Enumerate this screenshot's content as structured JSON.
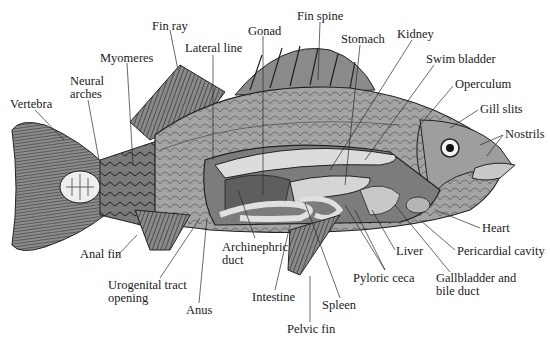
{
  "diagram": {
    "labels": [
      {
        "id": "fin-ray",
        "text": "Fin ray",
        "x": 152,
        "y": 20
      },
      {
        "id": "gonad",
        "text": "Gonad",
        "x": 248,
        "y": 25
      },
      {
        "id": "fin-spine",
        "text": "Fin spine",
        "x": 297,
        "y": 10
      },
      {
        "id": "kidney",
        "text": "Kidney",
        "x": 397,
        "y": 28
      },
      {
        "id": "stomach",
        "text": "Stomach",
        "x": 341,
        "y": 33
      },
      {
        "id": "lateral-line",
        "text": "Lateral line",
        "x": 185,
        "y": 42
      },
      {
        "id": "swim-bladder",
        "text": "Swim bladder",
        "x": 426,
        "y": 53
      },
      {
        "id": "myomeres",
        "text": "Myomeres",
        "x": 100,
        "y": 52
      },
      {
        "id": "neural-arches",
        "text": "Neural\narches",
        "x": 70,
        "y": 75
      },
      {
        "id": "operculum",
        "text": "Operculum",
        "x": 455,
        "y": 78
      },
      {
        "id": "vertebra",
        "text": "Vertebra",
        "x": 10,
        "y": 98
      },
      {
        "id": "gill-slits",
        "text": "Gill slits",
        "x": 480,
        "y": 103
      },
      {
        "id": "nostrils",
        "text": "Nostrils",
        "x": 505,
        "y": 128
      },
      {
        "id": "heart",
        "text": "Heart",
        "x": 482,
        "y": 222
      },
      {
        "id": "pericardial-cavity",
        "text": "Pericardial cavity",
        "x": 457,
        "y": 245
      },
      {
        "id": "liver",
        "text": "Liver",
        "x": 396,
        "y": 245
      },
      {
        "id": "archinephric-duct",
        "text": "Archinephric\nduct",
        "x": 222,
        "y": 241
      },
      {
        "id": "anal-fin",
        "text": "Anal fin",
        "x": 80,
        "y": 248
      },
      {
        "id": "gallbladder-bile-duct",
        "text": "Gallbladder and\nbile duct",
        "x": 436,
        "y": 272
      },
      {
        "id": "pyloric-ceca",
        "text": "Pyloric ceca",
        "x": 353,
        "y": 272
      },
      {
        "id": "urogenital-tract-opening",
        "text": "Urogenital tract\nopening",
        "x": 108,
        "y": 279
      },
      {
        "id": "intestine",
        "text": "Intestine",
        "x": 252,
        "y": 291
      },
      {
        "id": "anus",
        "text": "Anus",
        "x": 186,
        "y": 304
      },
      {
        "id": "spleen",
        "text": "Spleen",
        "x": 322,
        "y": 299
      },
      {
        "id": "pelvic-fin",
        "text": "Pelvic fin",
        "x": 287,
        "y": 323
      }
    ]
  },
  "colors": {
    "background": "#ffffff",
    "text": "#1a1a1a",
    "leader_line": "#2a2a2a",
    "fish_body": "#9a9a9a",
    "fish_dark": "#4a4a4a",
    "fin": "#6e6e6e",
    "organ_light": "#d8d8d8",
    "organ_mid": "#b0b0b0",
    "cavity": "#7c7c7c"
  }
}
